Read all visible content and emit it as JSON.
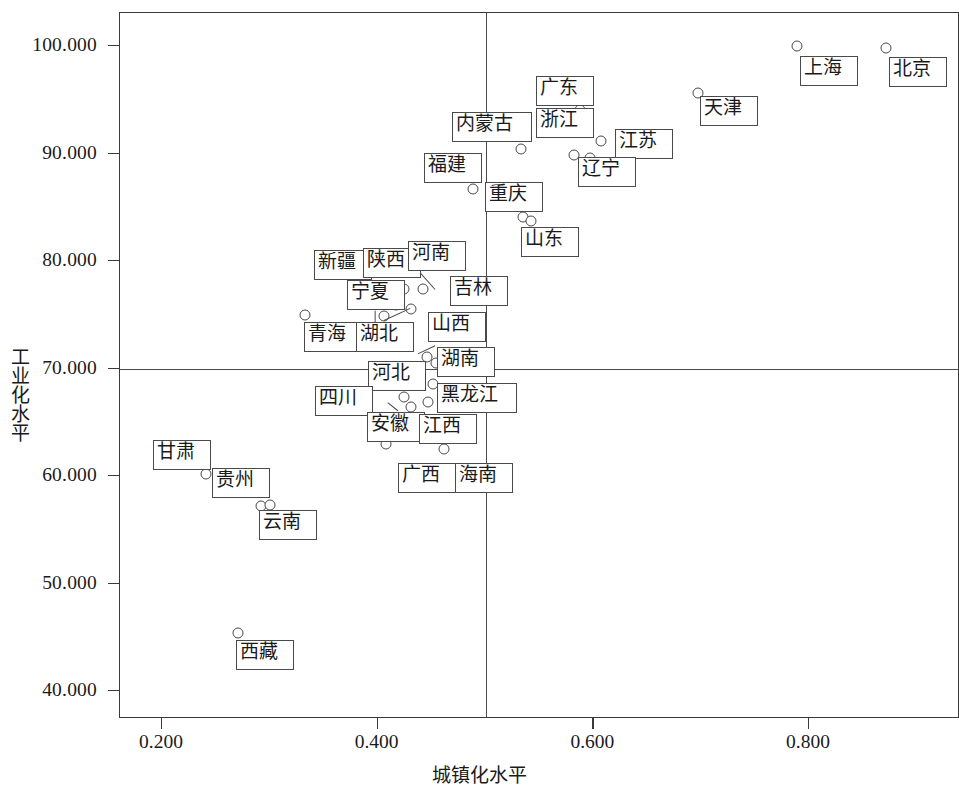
{
  "chart_data": {
    "type": "scatter",
    "title": "",
    "xlabel": "城镇化水平",
    "ylabel": "工业化水平",
    "xlim": [
      0.119,
      0.898
    ],
    "ylim": [
      37.3,
      102.8
    ],
    "xticks": [
      "0.200",
      "0.400",
      "0.600",
      "0.800"
    ],
    "xtick_values": [
      0.2,
      0.4,
      0.6,
      0.8
    ],
    "yticks": [
      "40.000",
      "50.000",
      "60.000",
      "70.000",
      "80.000",
      "90.000",
      "100.000"
    ],
    "ytick_values": [
      40,
      50,
      60,
      70,
      80,
      90,
      100
    ],
    "grid": "reference-lines",
    "reference_lines": {
      "horizontal": 70.0,
      "vertical": 0.5
    },
    "legend": "none",
    "marker": "open-circle",
    "points": [
      {
        "label": "北京",
        "x": 0.872,
        "y": 99.7,
        "lx": 889,
        "ly": 57,
        "lw": 58,
        "lh": 30
      },
      {
        "label": "上海",
        "x": 0.79,
        "y": 99.9,
        "lx": 800,
        "ly": 56,
        "lw": 58,
        "lh": 30
      },
      {
        "label": "天津",
        "x": 0.698,
        "y": 95.5,
        "lx": 700,
        "ly": 96,
        "lw": 58,
        "lh": 30
      },
      {
        "label": "广东",
        "x": 0.589,
        "y": 94.0,
        "lx": 536,
        "ly": 76,
        "lw": 58,
        "lh": 30
      },
      {
        "label": "浙江",
        "x": 0.583,
        "y": 89.8,
        "lx": 536,
        "ly": 108,
        "lw": 58,
        "lh": 30
      },
      {
        "label": "江苏",
        "x": 0.608,
        "y": 91.1,
        "lx": 615,
        "ly": 129,
        "lw": 58,
        "lh": 30
      },
      {
        "label": "辽宁",
        "x": 0.598,
        "y": 89.5,
        "lx": 578,
        "ly": 157,
        "lw": 58,
        "lh": 30
      },
      {
        "label": "内蒙古",
        "x": 0.534,
        "y": 90.3,
        "lx": 452,
        "ly": 112,
        "lw": 80,
        "lh": 30
      },
      {
        "label": "福建",
        "x": 0.489,
        "y": 86.6,
        "lx": 424,
        "ly": 153,
        "lw": 58,
        "lh": 30
      },
      {
        "label": "重庆",
        "x": 0.536,
        "y": 84.0,
        "lx": 485,
        "ly": 182,
        "lw": 58,
        "lh": 30
      },
      {
        "label": "山东",
        "x": 0.543,
        "y": 83.6,
        "lx": 521,
        "ly": 227,
        "lw": 58,
        "lh": 30
      },
      {
        "label": "新疆",
        "x": 0.398,
        "y": 77.1,
        "lx": 314,
        "ly": 250,
        "lw": 58,
        "lh": 30
      },
      {
        "label": "陕西",
        "x": 0.41,
        "y": 77.2,
        "lx": 363,
        "ly": 248,
        "lw": 58,
        "lh": 30
      },
      {
        "label": "河南",
        "x": 0.425,
        "y": 77.3,
        "lx": 408,
        "ly": 241,
        "lw": 58,
        "lh": 30
      },
      {
        "label": "宁夏",
        "x": 0.418,
        "y": 75.8,
        "lx": 347,
        "ly": 280,
        "lw": 58,
        "lh": 30
      },
      {
        "label": "吉林",
        "x": 0.443,
        "y": 77.3,
        "lx": 450,
        "ly": 276,
        "lw": 58,
        "lh": 30
      },
      {
        "label": "青海",
        "x": 0.334,
        "y": 74.9,
        "lx": 304,
        "ly": 322,
        "lw": 58,
        "lh": 30
      },
      {
        "label": "湖北",
        "x": 0.407,
        "y": 74.8,
        "lx": 356,
        "ly": 322,
        "lw": 58,
        "lh": 30
      },
      {
        "label": "山西",
        "x": 0.432,
        "y": 75.4,
        "lx": 428,
        "ly": 312,
        "lw": 58,
        "lh": 30
      },
      {
        "label": "湖南",
        "x": 0.447,
        "y": 71.0,
        "lx": 437,
        "ly": 347,
        "lw": 58,
        "lh": 30
      },
      {
        "label": "河北",
        "x": 0.455,
        "y": 70.4,
        "lx": 368,
        "ly": 361,
        "lw": 58,
        "lh": 30
      },
      {
        "label": "黑龙江",
        "x": 0.452,
        "y": 68.5,
        "lx": 437,
        "ly": 383,
        "lw": 80,
        "lh": 30
      },
      {
        "label": "四川",
        "x": 0.425,
        "y": 67.3,
        "lx": 315,
        "ly": 386,
        "lw": 58,
        "lh": 30
      },
      {
        "label": "安徽",
        "x": 0.432,
        "y": 66.3,
        "lx": 367,
        "ly": 412,
        "lw": 58,
        "lh": 30
      },
      {
        "label": "江西",
        "x": 0.448,
        "y": 66.8,
        "lx": 419,
        "ly": 414,
        "lw": 58,
        "lh": 30
      },
      {
        "label": "广西",
        "x": 0.409,
        "y": 62.9,
        "lx": 398,
        "ly": 463,
        "lw": 58,
        "lh": 30
      },
      {
        "label": "海南",
        "x": 0.462,
        "y": 62.4,
        "lx": 455,
        "ly": 463,
        "lw": 58,
        "lh": 30
      },
      {
        "label": "甘肃",
        "x": 0.242,
        "y": 60.1,
        "lx": 153,
        "ly": 440,
        "lw": 58,
        "lh": 30
      },
      {
        "label": "贵州",
        "x": 0.293,
        "y": 57.1,
        "lx": 212,
        "ly": 468,
        "lw": 58,
        "lh": 30
      },
      {
        "label": "云南",
        "x": 0.301,
        "y": 57.2,
        "lx": 259,
        "ly": 510,
        "lw": 58,
        "lh": 30
      },
      {
        "label": "西藏",
        "x": 0.271,
        "y": 45.3,
        "lx": 236,
        "ly": 640,
        "lw": 58,
        "lh": 30
      }
    ],
    "leaders": [
      {
        "from": "河南",
        "x1": 419,
        "y1": 271,
        "x2": 435,
        "y2": 289
      },
      {
        "from": "宁夏",
        "x1": 375,
        "y1": 310,
        "x2": 375,
        "y2": 322
      },
      {
        "from": "湖北",
        "x1": 384,
        "y1": 320,
        "x2": 410,
        "y2": 308
      },
      {
        "from": "湖南",
        "x1": 435,
        "y1": 345,
        "x2": 418,
        "y2": 353
      },
      {
        "from": "安徽",
        "x1": 398,
        "y1": 410,
        "x2": 388,
        "y2": 402
      }
    ]
  }
}
